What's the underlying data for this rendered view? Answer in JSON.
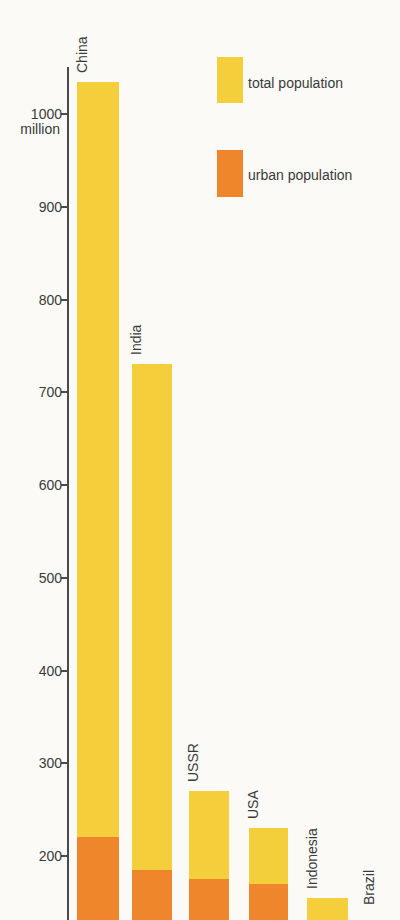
{
  "figure": {
    "background_color": "#FBFAF6",
    "text_color": "#3A3A3A",
    "axis_color": "#4A4A4A"
  },
  "legend": {
    "position": "top-right",
    "items": [
      {
        "name": "total population",
        "label": "total population",
        "color": "#F5CF3B"
      },
      {
        "name": "urban population",
        "label": "urban population",
        "color": "#F0862C"
      }
    ]
  },
  "chart_data": {
    "type": "bar",
    "title": "",
    "xlabel": "",
    "ylabel": "",
    "y_unit": "million",
    "grid": false,
    "legend_position": "top-right",
    "y_axis": {
      "tick_values": [
        1000,
        900,
        800,
        700,
        600,
        500,
        400,
        300,
        200
      ],
      "unit_label": "million",
      "visible_ylim": [
        130,
        1060
      ],
      "cropped_at_bottom": true
    },
    "categories": [
      "China",
      "India",
      "USSR",
      "USA",
      "Indonesia",
      "Brazil"
    ],
    "series": [
      {
        "name": "total population",
        "color": "#F5CF3B",
        "values": [
          1035,
          730,
          270,
          230,
          155,
          null
        ]
      },
      {
        "name": "urban population",
        "color": "#F0862C",
        "values": [
          220,
          185,
          175,
          170,
          null,
          null
        ]
      }
    ]
  }
}
